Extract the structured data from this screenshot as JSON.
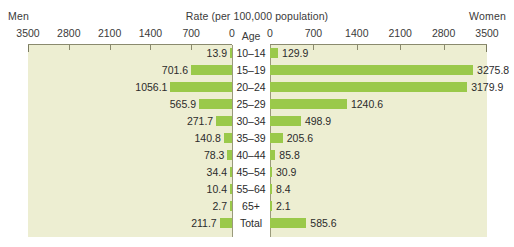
{
  "header": {
    "men_label": "Men",
    "women_label": "Women",
    "rate_title": "Rate (per 100,000 population)",
    "age_header": "Age"
  },
  "colors": {
    "bar": "#9ac94a",
    "panel_background": "#edeed2",
    "axis": "#8a8a6e",
    "text": "#2b2b2b"
  },
  "chart_data": {
    "type": "bar",
    "title": "Rate (per 100,000 population)",
    "subtitle": "",
    "orientation": "horizontal-diverging",
    "xlabel": "Rate (per 100,000 population)",
    "ylabel": "Age",
    "xlim": [
      0,
      3500
    ],
    "grid": false,
    "legend_position": "top-outside",
    "axis_ticks": [
      0,
      700,
      1400,
      2100,
      2800,
      3500
    ],
    "left_axis_ticks": [
      3500,
      2800,
      2100,
      1400,
      700,
      0
    ],
    "right_axis_ticks": [
      0,
      700,
      1400,
      2100,
      2800,
      3500
    ],
    "categories": [
      "10–14",
      "15–19",
      "20–24",
      "25–29",
      "30–34",
      "35–39",
      "40–44",
      "45–54",
      "55–64",
      "65+",
      "Total"
    ],
    "series": [
      {
        "name": "Men",
        "side": "left",
        "values": [
          13.9,
          701.6,
          1056.1,
          565.9,
          271.7,
          140.8,
          78.3,
          34.4,
          10.4,
          2.7,
          211.7
        ],
        "labels": [
          "13.9",
          "701.6",
          "1056.1",
          "565.9",
          "271.7",
          "140.8",
          "78.3",
          "34.4",
          "10.4",
          "2.7",
          "211.7"
        ]
      },
      {
        "name": "Women",
        "side": "right",
        "values": [
          129.9,
          3275.8,
          3179.9,
          1240.6,
          498.9,
          205.6,
          85.8,
          30.9,
          8.4,
          2.1,
          585.6
        ],
        "labels": [
          "129.9",
          "3275.8",
          "3179.9",
          "1240.6",
          "498.9",
          "205.6",
          "85.8",
          "30.9",
          "8.4",
          "2.1",
          "585.6"
        ]
      }
    ]
  }
}
